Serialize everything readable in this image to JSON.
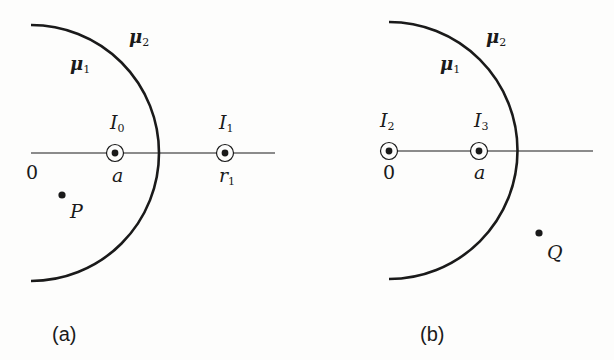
{
  "panels": [
    {
      "id": "a",
      "caption": "(a)",
      "region_inner": {
        "symbol": "μ",
        "sub": "1"
      },
      "region_outer": {
        "symbol": "μ",
        "sub": "2"
      },
      "currents": [
        {
          "symbol": "I",
          "sub": "0",
          "position_label": "a"
        },
        {
          "symbol": "I",
          "sub": "1",
          "position_label": "r",
          "position_sub": "1"
        }
      ],
      "origin_label": "0",
      "point_label": "P"
    },
    {
      "id": "b",
      "caption": "(b)",
      "region_inner": {
        "symbol": "μ",
        "sub": "1"
      },
      "region_outer": {
        "symbol": "μ",
        "sub": "2"
      },
      "currents": [
        {
          "symbol": "I",
          "sub": "2",
          "position_label": "0"
        },
        {
          "symbol": "I",
          "sub": "3",
          "position_label": "a"
        }
      ],
      "point_label": "Q"
    }
  ],
  "colors": {
    "ink": "#1a1a1a",
    "background": "#fdfdfc"
  }
}
